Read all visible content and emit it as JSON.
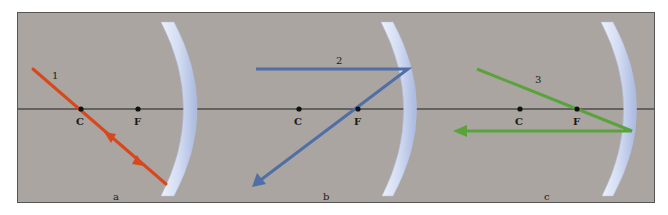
{
  "figure": {
    "background_color": "#aaa5a0",
    "axis_color": "#1e1e1e",
    "mirror_color": "#c9d3ee",
    "panels": [
      {
        "id": "a",
        "label": "a",
        "ray_label": "1",
        "ray_color": "#d9471c",
        "points": {
          "C": "C",
          "F": "F"
        },
        "description": "Ray through center of curvature C reflects back along itself"
      },
      {
        "id": "b",
        "label": "b",
        "ray_label": "2",
        "ray_color": "#4f6fa6",
        "points": {
          "C": "C",
          "F": "F"
        },
        "description": "Ray parallel to axis reflects through focal point F"
      },
      {
        "id": "c",
        "label": "c",
        "ray_label": "3",
        "ray_color": "#5aa33c",
        "points": {
          "C": "C",
          "F": "F"
        },
        "description": "Ray through focal point F reflects parallel to axis"
      }
    ]
  }
}
